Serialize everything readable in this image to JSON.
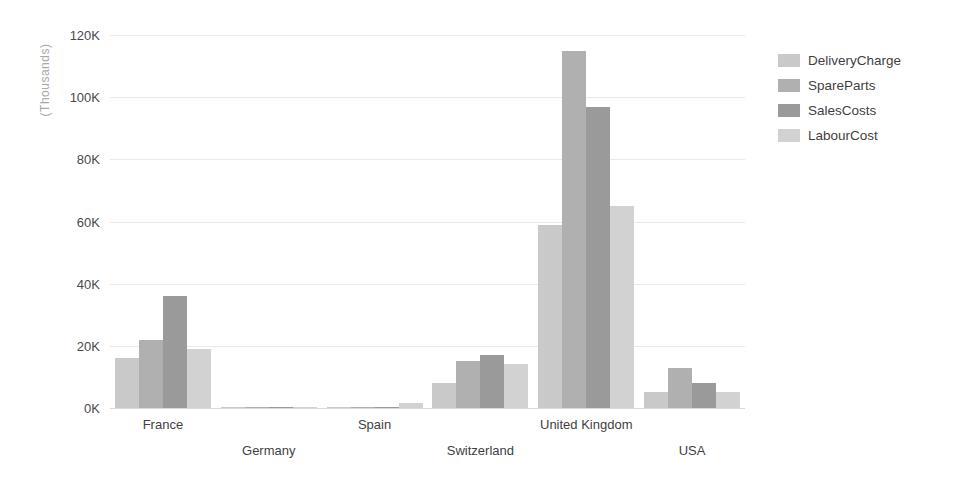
{
  "chart_data": {
    "type": "bar",
    "title": "",
    "subtitle": "",
    "xlabel": "",
    "ylabel": "(Thousands)",
    "categories": [
      "France",
      "Germany",
      "Spain",
      "Switzerland",
      "United Kingdom",
      "USA"
    ],
    "series": [
      {
        "name": "DeliveryCharge",
        "color": "#c9c9c9",
        "values": [
          16000,
          300,
          200,
          8000,
          59000,
          5000
        ]
      },
      {
        "name": "SpareParts",
        "color": "#b0b0b0",
        "values": [
          22000,
          300,
          300,
          15000,
          115000,
          13000
        ]
      },
      {
        "name": "SalesCosts",
        "color": "#9a9a9a",
        "values": [
          36000,
          300,
          400,
          17000,
          97000,
          8000
        ]
      },
      {
        "name": "LabourCost",
        "color": "#d2d2d2",
        "values": [
          19000,
          300,
          1500,
          14000,
          65000,
          5000
        ]
      }
    ],
    "ylim": [
      0,
      120000
    ],
    "y_ticks": [
      0,
      20000,
      40000,
      60000,
      80000,
      100000,
      120000
    ],
    "y_tick_labels": [
      "0K",
      "20K",
      "40K",
      "60K",
      "80K",
      "100K",
      "120K"
    ],
    "grid": true,
    "legend_position": "right",
    "value_unit": "Thousands"
  },
  "legend": {
    "items": [
      {
        "label": "DeliveryCharge",
        "color": "#c9c9c9"
      },
      {
        "label": "SpareParts",
        "color": "#b0b0b0"
      },
      {
        "label": "SalesCosts",
        "color": "#9a9a9a"
      },
      {
        "label": "LabourCost",
        "color": "#d2d2d2"
      }
    ]
  },
  "axes": {
    "y_title": "(Thousands)",
    "y_tick_labels": [
      "120K",
      "100K",
      "80K",
      "60K",
      "40K",
      "20K",
      "0K"
    ],
    "x_tick_labels": [
      "France",
      "Germany",
      "Spain",
      "Switzerland",
      "United Kingdom",
      "USA"
    ]
  },
  "colors": {
    "background": "#ffffff",
    "gridline": "#e9e9e9",
    "baseline": "#d9d9d9",
    "tick_text": "#4a4a4a",
    "axis_title": "#a8a8a8"
  }
}
